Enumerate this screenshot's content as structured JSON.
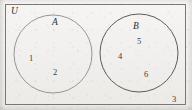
{
  "figure": {
    "type": "venn-diagram",
    "width": 192,
    "height": 110,
    "background_color": "#f2f1ef",
    "universe": {
      "label": "U",
      "shape": "rectangle",
      "stroke_color": "#7a7874",
      "bounds": {
        "x": 5,
        "y": 4,
        "width": 181,
        "height": 101
      },
      "label_position": {
        "x": 11,
        "y": 7
      }
    },
    "sets": [
      {
        "id": "A",
        "label": "A",
        "shape": "circle",
        "stroke_color": "#8d8b87",
        "center": {
          "x": 53,
          "y": 54
        },
        "radius": 39,
        "label_position": {
          "x": 52,
          "y": 18
        },
        "elements": [
          {
            "value": "1",
            "x": 29,
            "y": 54
          },
          {
            "value": "2",
            "x": 53,
            "y": 68
          }
        ]
      },
      {
        "id": "B",
        "label": "B",
        "shape": "circle",
        "stroke_color": "#5d5b57",
        "center": {
          "x": 139,
          "y": 53
        },
        "radius": 39,
        "label_position": {
          "x": 133,
          "y": 22
        },
        "elements": [
          {
            "value": "4",
            "x": 118,
            "y": 52
          },
          {
            "value": "5",
            "x": 137,
            "y": 37
          },
          {
            "value": "6",
            "x": 144,
            "y": 70
          }
        ]
      }
    ],
    "outside_elements": [
      {
        "value": "3",
        "x": 172,
        "y": 95
      }
    ],
    "intersection": {
      "overlaps": false,
      "members": []
    },
    "text_color": "#3a3935"
  }
}
